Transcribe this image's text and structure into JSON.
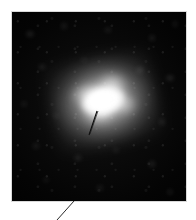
{
  "figure": {
    "kind": "astronomical-image-plate",
    "caption": "",
    "panel": {
      "background_color": "#050505",
      "border_color": "#d9d9d9",
      "x": 12,
      "y": 12,
      "width": 174,
      "height": 189
    },
    "page_background_color": "#ffffff"
  },
  "object": {
    "name": "central-bright-source",
    "label": "",
    "core_color": "#ffffff",
    "halo_color": "#c8c8c8",
    "center_x": 96,
    "center_y": 98,
    "position_angle_deg": -13
  },
  "annotations": {
    "marker": {
      "name": "object-marker-tick",
      "color": "#101010",
      "x1": 97,
      "y1": 111,
      "x2": 89,
      "y2": 135
    },
    "leader": {
      "name": "caption-leader-line",
      "color": "#2a2a2a",
      "x1": 74,
      "y1": 201,
      "x2": 57,
      "y2": 220
    }
  }
}
